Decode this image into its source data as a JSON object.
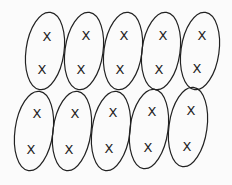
{
  "diagram": {
    "stroke_color": "#222222",
    "background": "#fbfbfb",
    "mark_symbol": "X",
    "rows": [
      {
        "ellipses": [
          {
            "cx": 45,
            "cy": 51,
            "rx": 19,
            "ry": 39,
            "rot": 8,
            "marks": [
              {
                "x": 47,
                "y": 37,
                "label": "X"
              },
              {
                "x": 42,
                "y": 70,
                "label": "X"
              }
            ]
          },
          {
            "cx": 84,
            "cy": 51,
            "rx": 19,
            "ry": 39,
            "rot": 8,
            "marks": [
              {
                "x": 86,
                "y": 36,
                "label": "X"
              },
              {
                "x": 81,
                "y": 70,
                "label": "X"
              }
            ]
          },
          {
            "cx": 123,
            "cy": 51,
            "rx": 19,
            "ry": 39,
            "rot": 8,
            "marks": [
              {
                "x": 124,
                "y": 36,
                "label": "X"
              },
              {
                "x": 120,
                "y": 70,
                "label": "X"
              }
            ]
          },
          {
            "cx": 161,
            "cy": 51,
            "rx": 19,
            "ry": 39,
            "rot": 8,
            "marks": [
              {
                "x": 163,
                "y": 36,
                "label": "X"
              },
              {
                "x": 159,
                "y": 70,
                "label": "X"
              }
            ]
          },
          {
            "cx": 200,
            "cy": 51,
            "rx": 19,
            "ry": 39,
            "rot": 8,
            "marks": [
              {
                "x": 202,
                "y": 36,
                "label": "X"
              },
              {
                "x": 197,
                "y": 69,
                "label": "X"
              }
            ]
          }
        ]
      },
      {
        "ellipses": [
          {
            "cx": 34,
            "cy": 131,
            "rx": 19,
            "ry": 40,
            "rot": 8,
            "marks": [
              {
                "x": 37,
                "y": 114,
                "label": "X"
              },
              {
                "x": 31,
                "y": 150,
                "label": "X"
              }
            ]
          },
          {
            "cx": 72,
            "cy": 131,
            "rx": 19,
            "ry": 40,
            "rot": 8,
            "marks": [
              {
                "x": 75,
                "y": 114,
                "label": "X"
              },
              {
                "x": 69,
                "y": 150,
                "label": "X"
              }
            ]
          },
          {
            "cx": 111,
            "cy": 131,
            "rx": 19,
            "ry": 40,
            "rot": 8,
            "marks": [
              {
                "x": 113,
                "y": 113,
                "label": "X"
              },
              {
                "x": 109,
                "y": 149,
                "label": "X"
              }
            ]
          },
          {
            "cx": 149,
            "cy": 129,
            "rx": 19,
            "ry": 40,
            "rot": 8,
            "marks": [
              {
                "x": 152,
                "y": 112,
                "label": "X"
              },
              {
                "x": 148,
                "y": 148,
                "label": "X"
              }
            ]
          },
          {
            "cx": 188,
            "cy": 127,
            "rx": 19,
            "ry": 40,
            "rot": 8,
            "marks": [
              {
                "x": 191,
                "y": 111,
                "label": "X"
              },
              {
                "x": 187,
                "y": 147,
                "label": "X"
              }
            ]
          }
        ]
      }
    ]
  }
}
